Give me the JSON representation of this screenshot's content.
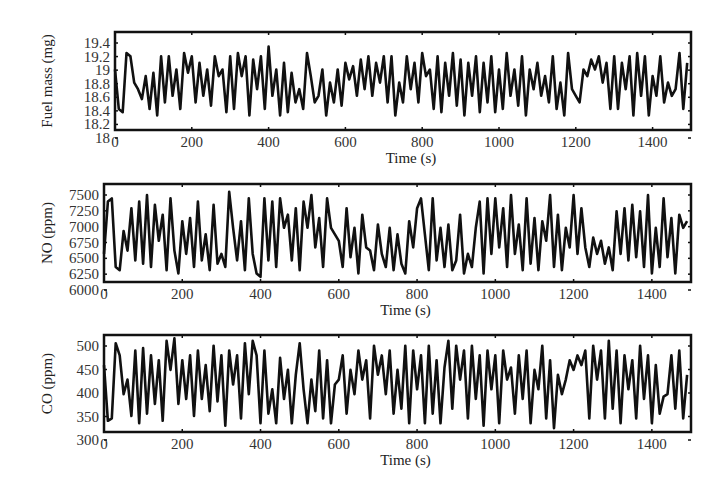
{
  "chart_data": [
    {
      "type": "line",
      "title": "",
      "xlabel": "Time (s)",
      "ylabel": "Fuel mass (mg)",
      "xlim": [
        0,
        1500
      ],
      "ylim": [
        18.08,
        19.57
      ],
      "xticks": [
        0,
        200,
        400,
        600,
        800,
        1000,
        1200,
        1400
      ],
      "yticks": [
        18,
        18.2,
        18.4,
        18.6,
        18.8,
        19,
        19.2,
        19.4
      ],
      "ytick_labels": [
        "18",
        "18.2",
        "18.4",
        "18.6",
        "18.8",
        "19",
        "19.2",
        "19.4"
      ],
      "grid": false,
      "legend": null,
      "series": [
        {
          "name": "Fuel mass",
          "color": "#111111",
          "x": [
            0,
            10,
            20,
            30,
            40,
            50,
            60,
            70,
            80,
            90,
            100,
            110,
            120,
            130,
            140,
            150,
            160,
            170,
            180,
            190,
            200,
            210,
            220,
            230,
            240,
            250,
            260,
            270,
            280,
            290,
            300,
            310,
            320,
            330,
            340,
            350,
            360,
            370,
            380,
            390,
            400,
            410,
            420,
            430,
            440,
            450,
            460,
            470,
            480,
            490,
            500,
            510,
            520,
            530,
            540,
            550,
            560,
            570,
            580,
            590,
            600,
            610,
            620,
            630,
            640,
            650,
            660,
            670,
            680,
            690,
            700,
            710,
            720,
            730,
            740,
            750,
            760,
            770,
            780,
            790,
            800,
            810,
            820,
            830,
            840,
            850,
            860,
            870,
            880,
            890,
            900,
            910,
            920,
            930,
            940,
            950,
            960,
            970,
            980,
            990,
            1000,
            1010,
            1020,
            1030,
            1040,
            1050,
            1060,
            1070,
            1080,
            1090,
            1100,
            1110,
            1120,
            1130,
            1140,
            1150,
            1160,
            1170,
            1180,
            1190,
            1200,
            1210,
            1220,
            1230,
            1240,
            1250,
            1260,
            1270,
            1280,
            1290,
            1300,
            1310,
            1320,
            1330,
            1340,
            1350,
            1360,
            1370,
            1380,
            1390,
            1400,
            1410,
            1420,
            1430,
            1440,
            1450,
            1460,
            1470,
            1480,
            1490
          ],
          "values": [
            19.0,
            18.4,
            18.35,
            19.25,
            19.2,
            18.8,
            18.7,
            18.55,
            18.9,
            18.4,
            18.95,
            18.3,
            19.2,
            18.5,
            19.2,
            18.6,
            19.0,
            18.4,
            19.25,
            18.95,
            19.2,
            18.5,
            19.1,
            18.6,
            19.0,
            18.45,
            19.2,
            18.9,
            19.0,
            18.35,
            19.2,
            18.4,
            19.25,
            18.9,
            19.2,
            18.3,
            19.15,
            18.7,
            19.2,
            18.4,
            19.35,
            18.6,
            19.0,
            18.3,
            19.1,
            18.35,
            18.95,
            18.5,
            18.7,
            18.4,
            19.25,
            18.9,
            18.5,
            18.6,
            19.0,
            18.3,
            18.8,
            18.5,
            19.0,
            18.45,
            19.1,
            18.85,
            19.05,
            18.6,
            19.15,
            18.7,
            19.2,
            18.6,
            19.1,
            18.8,
            19.2,
            18.5,
            19.2,
            18.3,
            18.8,
            18.5,
            19.2,
            18.7,
            19.1,
            18.5,
            19.25,
            18.9,
            19.0,
            18.4,
            19.2,
            18.35,
            19.1,
            18.6,
            19.25,
            18.45,
            19.15,
            18.3,
            19.1,
            18.6,
            19.2,
            18.35,
            19.1,
            18.5,
            19.2,
            18.35,
            19.0,
            18.4,
            19.25,
            18.6,
            19.0,
            18.45,
            19.2,
            18.3,
            19.0,
            18.7,
            19.1,
            18.6,
            18.9,
            18.5,
            19.2,
            18.4,
            18.8,
            18.3,
            19.25,
            18.7,
            18.6,
            18.5,
            19.0,
            18.9,
            19.15,
            19.0,
            19.2,
            18.8,
            19.1,
            18.4,
            19.2,
            18.4,
            19.1,
            18.7,
            19.2,
            18.3,
            19.25,
            18.6,
            19.2,
            18.3,
            18.9,
            18.6,
            19.2,
            18.5,
            18.8,
            18.6,
            18.7,
            19.25,
            18.4,
            19.1
          ]
        }
      ]
    },
    {
      "type": "line",
      "title": "",
      "xlabel": "Time (s)",
      "ylabel": "NO (ppm)",
      "xlim": [
        0,
        1500
      ],
      "ylim": [
        6070,
        7570
      ],
      "xticks": [
        0,
        200,
        400,
        600,
        800,
        1000,
        1200,
        1400
      ],
      "yticks": [
        6000,
        6250,
        6500,
        6750,
        7000,
        7250,
        7500
      ],
      "ytick_labels": [
        "6000",
        "6250",
        "6500",
        "6750",
        "7000",
        "7250",
        "7500"
      ],
      "grid": false,
      "legend": null,
      "series": [
        {
          "name": "NO",
          "color": "#111111",
          "x": [
            0,
            10,
            20,
            30,
            40,
            50,
            60,
            70,
            80,
            90,
            100,
            110,
            120,
            130,
            140,
            150,
            160,
            170,
            180,
            190,
            200,
            210,
            220,
            230,
            240,
            250,
            260,
            270,
            280,
            290,
            300,
            310,
            320,
            330,
            340,
            350,
            360,
            370,
            380,
            390,
            400,
            410,
            420,
            430,
            440,
            450,
            460,
            470,
            480,
            490,
            500,
            510,
            520,
            530,
            540,
            550,
            560,
            570,
            580,
            590,
            600,
            610,
            620,
            630,
            640,
            650,
            660,
            670,
            680,
            690,
            700,
            710,
            720,
            730,
            740,
            750,
            760,
            770,
            780,
            790,
            800,
            810,
            820,
            830,
            840,
            850,
            860,
            870,
            880,
            890,
            900,
            910,
            920,
            930,
            940,
            950,
            960,
            970,
            980,
            990,
            1000,
            1010,
            1020,
            1030,
            1040,
            1050,
            1060,
            1070,
            1080,
            1090,
            1100,
            1110,
            1120,
            1130,
            1140,
            1150,
            1160,
            1170,
            1180,
            1190,
            1200,
            1210,
            1220,
            1230,
            1240,
            1250,
            1260,
            1270,
            1280,
            1290,
            1300,
            1310,
            1320,
            1330,
            1340,
            1350,
            1360,
            1370,
            1380,
            1390,
            1400,
            1410,
            1420,
            1430,
            1440,
            1450,
            1460,
            1470,
            1480,
            1490
          ],
          "values": [
            6500,
            7300,
            7350,
            6300,
            6250,
            6850,
            6550,
            7200,
            6400,
            7300,
            6350,
            7400,
            6300,
            7250,
            6700,
            7100,
            6250,
            7350,
            6550,
            6200,
            7000,
            6500,
            7050,
            6300,
            7300,
            6400,
            6800,
            6250,
            7250,
            6350,
            6500,
            6300,
            7450,
            6900,
            6400,
            7000,
            6250,
            7350,
            6500,
            6200,
            6150,
            7350,
            6400,
            7300,
            6300,
            7350,
            6900,
            7100,
            6400,
            7200,
            6250,
            7300,
            6900,
            7400,
            6600,
            7050,
            6300,
            7350,
            6900,
            6800,
            6700,
            6300,
            7200,
            6450,
            6900,
            6200,
            7100,
            6600,
            6550,
            6250,
            6950,
            6500,
            6300,
            6900,
            6250,
            6800,
            6350,
            6200,
            7000,
            6600,
            7200,
            7350,
            6800,
            6250,
            7350,
            6400,
            6900,
            6300,
            6950,
            6250,
            6400,
            7100,
            6200,
            6500,
            6300,
            6900,
            7300,
            6200,
            7350,
            6500,
            7350,
            6600,
            7200,
            6300,
            7400,
            6500,
            6950,
            6250,
            7350,
            6350,
            7050,
            6250,
            7000,
            6700,
            7400,
            6300,
            7100,
            6250,
            6900,
            6600,
            7400,
            6500,
            7200,
            6600,
            6300,
            6750,
            6500,
            6700,
            6350,
            6600,
            6250,
            7150,
            6500,
            7200,
            6400,
            7250,
            6450,
            7150,
            6300,
            7400,
            6200,
            6900,
            6300,
            7350,
            6450,
            7050,
            6200,
            7100,
            6900,
            7000,
            6350,
            7350
          ]
        }
      ]
    },
    {
      "type": "line",
      "title": "",
      "xlabel": "Time (s)",
      "ylabel": "CO (ppm)",
      "xlim": [
        0,
        1500
      ],
      "ylim": [
        312,
        512
      ],
      "xticks": [
        0,
        200,
        400,
        600,
        800,
        1000,
        1200,
        1400
      ],
      "yticks": [
        300,
        350,
        400,
        450,
        500
      ],
      "ytick_labels": [
        "300",
        "350",
        "400",
        "450",
        "500"
      ],
      "grid": false,
      "legend": null,
      "series": [
        {
          "name": "CO",
          "color": "#111111",
          "x": [
            0,
            10,
            20,
            30,
            40,
            50,
            60,
            70,
            80,
            90,
            100,
            110,
            120,
            130,
            140,
            150,
            160,
            170,
            180,
            190,
            200,
            210,
            220,
            230,
            240,
            250,
            260,
            270,
            280,
            290,
            300,
            310,
            320,
            330,
            340,
            350,
            360,
            370,
            380,
            390,
            400,
            410,
            420,
            430,
            440,
            450,
            460,
            470,
            480,
            490,
            500,
            510,
            520,
            530,
            540,
            550,
            560,
            570,
            580,
            590,
            600,
            610,
            620,
            630,
            640,
            650,
            660,
            670,
            680,
            690,
            700,
            710,
            720,
            730,
            740,
            750,
            760,
            770,
            780,
            790,
            800,
            810,
            820,
            830,
            840,
            850,
            860,
            870,
            880,
            890,
            900,
            910,
            920,
            930,
            940,
            950,
            960,
            970,
            980,
            990,
            1000,
            1010,
            1020,
            1030,
            1040,
            1050,
            1060,
            1070,
            1080,
            1090,
            1100,
            1110,
            1120,
            1130,
            1140,
            1150,
            1160,
            1170,
            1180,
            1190,
            1200,
            1210,
            1220,
            1230,
            1240,
            1250,
            1260,
            1270,
            1280,
            1290,
            1300,
            1310,
            1320,
            1330,
            1340,
            1350,
            1360,
            1370,
            1380,
            1390,
            1400,
            1410,
            1420,
            1430,
            1440,
            1450,
            1460,
            1470,
            1480,
            1490
          ],
          "values": [
            450,
            335,
            340,
            495,
            470,
            390,
            420,
            345,
            480,
            330,
            485,
            350,
            470,
            370,
            460,
            335,
            500,
            440,
            505,
            370,
            460,
            380,
            470,
            345,
            480,
            380,
            450,
            355,
            490,
            375,
            470,
            325,
            480,
            410,
            470,
            340,
            495,
            390,
            500,
            470,
            330,
            480,
            350,
            400,
            330,
            465,
            380,
            440,
            330,
            430,
            495,
            400,
            330,
            420,
            355,
            480,
            340,
            460,
            330,
            410,
            420,
            470,
            350,
            440,
            390,
            480,
            420,
            460,
            340,
            490,
            430,
            470,
            390,
            480,
            350,
            440,
            360,
            490,
            330,
            480,
            400,
            470,
            330,
            490,
            350,
            460,
            330,
            445,
            500,
            360,
            490,
            420,
            480,
            340,
            490,
            380,
            470,
            325,
            480,
            400,
            470,
            330,
            480,
            420,
            445,
            350,
            470,
            380,
            480,
            330,
            440,
            400,
            490,
            340,
            460,
            320,
            430,
            390,
            420,
            460,
            440,
            470,
            450,
            480,
            340,
            490,
            420,
            480,
            340,
            500,
            360,
            480,
            330,
            470,
            400,
            460,
            340,
            490,
            380,
            470,
            330,
            450,
            350,
            385,
            390,
            470,
            360,
            480,
            340,
            430
          ]
        }
      ]
    }
  ],
  "plots": [
    {
      "ylabel": "Fuel mass (mg)",
      "xlabel": "Time (s)"
    },
    {
      "ylabel": "NO (ppm)",
      "xlabel": "Time (s)"
    },
    {
      "ylabel": "CO (ppm)",
      "xlabel": "Time (s)"
    }
  ]
}
